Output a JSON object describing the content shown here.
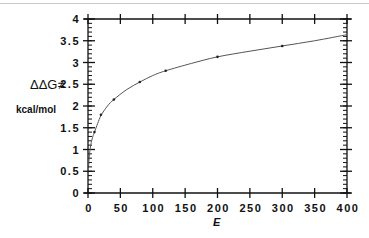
{
  "chart_data": {
    "type": "line",
    "title": "",
    "xlabel": "E",
    "ylabel": "ΔΔG≠",
    "ylabel_unit": "kcal/mol",
    "xlim": [
      0,
      400
    ],
    "ylim": [
      0,
      4
    ],
    "x_ticks": [
      0,
      50,
      100,
      150,
      200,
      250,
      300,
      350,
      400
    ],
    "x_tick_labels": [
      "0",
      "50",
      "100",
      "150",
      "200",
      "250",
      "300",
      "350",
      "400"
    ],
    "y_ticks": [
      0,
      0.5,
      1,
      1.5,
      2,
      2.5,
      3,
      3.5,
      4
    ],
    "y_tick_labels": [
      "0",
      "0.5",
      "1",
      "1.5",
      "2",
      "2.5",
      "3",
      "3.5",
      "4"
    ],
    "y_minor_step": 0.1,
    "grid": false,
    "series": [
      {
        "name": "fit",
        "kind": "line",
        "x": [
          1,
          2,
          4,
          6,
          8,
          10,
          15,
          20,
          30,
          40,
          60,
          80,
          100,
          120,
          160,
          200,
          250,
          300,
          350,
          400
        ],
        "values": [
          0.62,
          0.85,
          1.08,
          1.22,
          1.32,
          1.4,
          1.6,
          1.78,
          2.0,
          2.15,
          2.38,
          2.55,
          2.7,
          2.81,
          2.98,
          3.13,
          3.26,
          3.38,
          3.5,
          3.64
        ]
      },
      {
        "name": "data",
        "kind": "points",
        "x": [
          10,
          20,
          40,
          80,
          120,
          200,
          300
        ],
        "values": [
          1.4,
          1.8,
          2.15,
          2.55,
          2.81,
          3.13,
          3.38
        ]
      }
    ]
  }
}
